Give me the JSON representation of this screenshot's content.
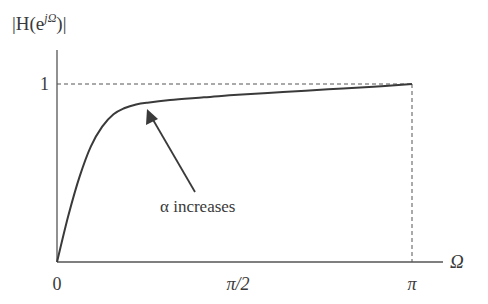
{
  "chart_data": {
    "type": "line",
    "title": "",
    "ylabel": "|H(e^{jΩ})|",
    "xlabel": "Ω",
    "y_axis_label_parts": {
      "pre": "|H(e",
      "sup": "jΩ",
      "post": ")|"
    },
    "x_ticks": [
      {
        "label": "0",
        "value": 0
      },
      {
        "label": "π/2",
        "value": 1.5708
      },
      {
        "label": "π",
        "value": 3.1416
      }
    ],
    "y_ticks": [
      {
        "label": "1",
        "value": 1
      }
    ],
    "xlim": [
      0,
      3.1416
    ],
    "ylim": [
      0,
      1.15
    ],
    "grid": false,
    "reference_lines": [
      {
        "type": "horizontal-dashed",
        "y": 1,
        "from_x": 0,
        "to_x": 3.1416
      },
      {
        "type": "vertical-dashed",
        "x": 3.1416,
        "from_y": 0,
        "to_y": 1
      }
    ],
    "series": [
      {
        "name": "magnitude response",
        "x": [
          0,
          0.1,
          0.2,
          0.3,
          0.4,
          0.5,
          0.6,
          0.7,
          0.8,
          1.0,
          1.3,
          1.6,
          2.0,
          2.4,
          2.8,
          3.1416
        ],
        "y": [
          0,
          0.26,
          0.48,
          0.65,
          0.76,
          0.83,
          0.865,
          0.885,
          0.895,
          0.91,
          0.925,
          0.94,
          0.955,
          0.97,
          0.985,
          1.0
        ]
      }
    ],
    "annotations": [
      {
        "text": "α increases",
        "arrow_to": {
          "x": 0.81,
          "y": 0.89
        }
      }
    ]
  }
}
